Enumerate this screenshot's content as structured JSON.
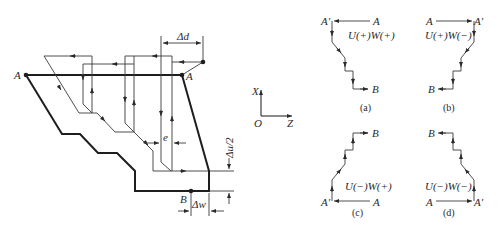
{
  "main_diagram": {
    "labels": {
      "start_left": "A",
      "start_right": "A",
      "end_point": "B",
      "delta_d": "Δd",
      "delta_u_half": "Δu/2",
      "delta_w": "Δw",
      "e": "e"
    }
  },
  "axes": {
    "x_label": "X",
    "z_label": "Z",
    "origin_label": "O"
  },
  "subfigures": [
    {
      "id": "a",
      "caption": "(a)",
      "sign_label": "U(+)W(+)",
      "start": "A",
      "prime": "A′",
      "end": "B"
    },
    {
      "id": "b",
      "caption": "(b)",
      "sign_label": "U(+)W(−)",
      "start": "A",
      "prime": "A′",
      "end": "B"
    },
    {
      "id": "c",
      "caption": "(c)",
      "sign_label": "U(−)W(+)",
      "start": "A",
      "prime": "A′",
      "end": "B"
    },
    {
      "id": "d",
      "caption": "(d)",
      "sign_label": "U(−)W(−)",
      "start": "A",
      "prime": "A′",
      "end": "B"
    }
  ],
  "colors": {
    "line": "#1e1e1e",
    "background": "#ffffff"
  }
}
